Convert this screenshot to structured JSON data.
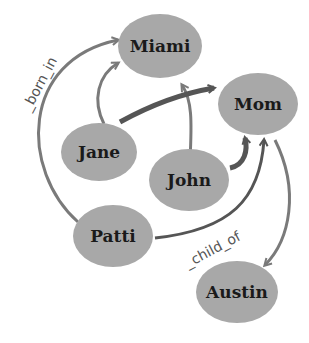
{
  "diagram": {
    "type": "directed-graph",
    "colors": {
      "node_fill": "#a8a8a8",
      "edge": "#7a7a7a",
      "edge_dark": "#555555",
      "text": "#1a1a1a"
    },
    "nodes": [
      {
        "id": "miami",
        "label": "Miami"
      },
      {
        "id": "mom",
        "label": "Mom"
      },
      {
        "id": "jane",
        "label": "Jane"
      },
      {
        "id": "john",
        "label": "John"
      },
      {
        "id": "patti",
        "label": "Patti"
      },
      {
        "id": "austin",
        "label": "Austin"
      }
    ],
    "edge_labels": {
      "born_in": "_born_in",
      "child_of": "_child_of"
    },
    "edges": [
      {
        "from": "patti",
        "to": "miami",
        "label": "_born_in"
      },
      {
        "from": "jane",
        "to": "miami"
      },
      {
        "from": "john",
        "to": "miami"
      },
      {
        "from": "jane",
        "to": "mom"
      },
      {
        "from": "john",
        "to": "mom"
      },
      {
        "from": "patti",
        "to": "mom",
        "label": "_child_of"
      },
      {
        "from": "mom",
        "to": "austin"
      }
    ]
  }
}
